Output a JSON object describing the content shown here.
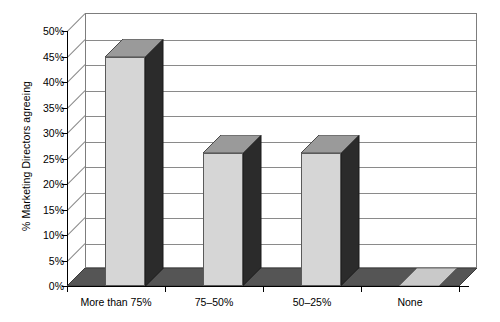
{
  "chart_data": {
    "type": "bar",
    "title": "",
    "subtitle": "",
    "xlabel": "",
    "ylabel": "% Marketing Directors agreeing",
    "categories": [
      "More than 75%",
      "75–50%",
      "50–25%",
      "None"
    ],
    "values": [
      45,
      26,
      26,
      0
    ],
    "ylim": [
      0,
      50
    ],
    "ytick_labels": [
      "0%",
      "5%",
      "10%",
      "15%",
      "20%",
      "25%",
      "30%",
      "35%",
      "40%",
      "45%",
      "50%"
    ],
    "ytick_values": [
      0,
      5,
      10,
      15,
      20,
      25,
      30,
      35,
      40,
      45,
      50
    ],
    "grid": true,
    "legend": false,
    "legend_position": "none",
    "style": "3d-column",
    "colors": {
      "bar_front": "#d6d6d6",
      "bar_top": "#9a9a9a",
      "bar_side": "#2b2b2b",
      "floor": "#555555",
      "gridline": "#8a8a8a",
      "axis": "#000000",
      "background": "#ffffff"
    }
  }
}
